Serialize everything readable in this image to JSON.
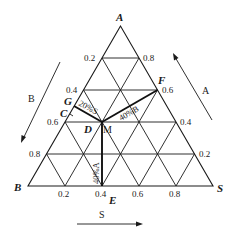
{
  "diagram": {
    "type": "ternary-phase-diagram",
    "vertices": {
      "top": "A",
      "bottom_left": "B",
      "bottom_right": "S"
    },
    "left_edge_ticks": [
      "0.2",
      "0.4",
      "0.6",
      "0.8"
    ],
    "right_edge_ticks": [
      "0.8",
      "0.6",
      "0.4",
      "0.2"
    ],
    "bottom_edge_ticks": [
      "0.2",
      "0.4",
      "0.6",
      "0.8"
    ],
    "points": {
      "G": "G",
      "C": "C",
      "D": "D",
      "M": "M",
      "F": "F",
      "E": "E"
    },
    "segment_labels": {
      "GM": "20%S",
      "MF": "40%B",
      "ME": "40%A"
    },
    "direction_arrows": {
      "A": "A",
      "B": "B",
      "S": "S"
    },
    "colors": {
      "line": "#1a1a1a",
      "background": "#ffffff"
    }
  }
}
